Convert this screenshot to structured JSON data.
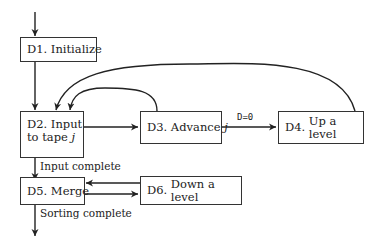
{
  "diagram": {
    "type": "flowchart",
    "nodes": {
      "d1": {
        "id": "D1.",
        "label": "Initialize"
      },
      "d2": {
        "id": "D2.",
        "label_line1": "Input",
        "label_line2": "to tape",
        "var": "j"
      },
      "d3": {
        "id": "D3.",
        "label": "Advance",
        "var": "j"
      },
      "d4": {
        "id": "D4.",
        "label": "Up a level"
      },
      "d5": {
        "id": "D5.",
        "label": "Merge"
      },
      "d6": {
        "id": "D6.",
        "label": "Down a level"
      }
    },
    "edge_labels": {
      "d3_to_d4": "D=0",
      "d2_to_d5": "Input complete",
      "d5_exit": "Sorting complete"
    },
    "edges": [
      {
        "from": "start",
        "to": "D1"
      },
      {
        "from": "D1",
        "to": "D2"
      },
      {
        "from": "D2",
        "to": "D3"
      },
      {
        "from": "D3",
        "to": "D4",
        "label": "D=0"
      },
      {
        "from": "D3",
        "to": "D2"
      },
      {
        "from": "D4",
        "to": "D2"
      },
      {
        "from": "D2",
        "to": "D5",
        "label": "Input complete"
      },
      {
        "from": "D5",
        "to": "D6"
      },
      {
        "from": "D6",
        "to": "D5"
      },
      {
        "from": "D5",
        "to": "end",
        "label": "Sorting complete"
      }
    ]
  }
}
